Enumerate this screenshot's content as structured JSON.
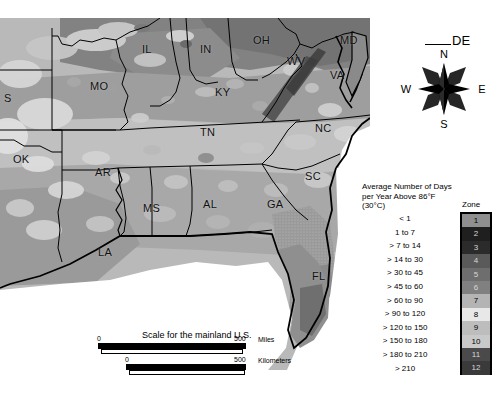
{
  "map": {
    "title": "Average Number of Days per Year Above 86°F (30°C)",
    "background_color": "#b9b9b9",
    "state_labels": [
      {
        "abbr": "S",
        "x": 4,
        "y": 74,
        "note": "Kansas, clipped at left edge"
      },
      {
        "abbr": "IL",
        "x": 142,
        "y": 25,
        "note": "Illinois"
      },
      {
        "abbr": "IN",
        "x": 200,
        "y": 25,
        "note": "Indiana"
      },
      {
        "abbr": "OH",
        "x": 253,
        "y": 16,
        "note": "Ohio"
      },
      {
        "abbr": "WV",
        "x": 287,
        "y": 37,
        "note": "West Virginia"
      },
      {
        "abbr": "MD",
        "x": 340,
        "y": 16,
        "note": "Maryland"
      },
      {
        "abbr": "VA",
        "x": 330,
        "y": 51,
        "note": "Virginia"
      },
      {
        "abbr": "MO",
        "x": 90,
        "y": 62,
        "note": "Missouri"
      },
      {
        "abbr": "KY",
        "x": 215,
        "y": 68,
        "note": "Kentucky"
      },
      {
        "abbr": "NC",
        "x": 315,
        "y": 104,
        "note": "North Carolina"
      },
      {
        "abbr": "TN",
        "x": 200,
        "y": 108,
        "note": "Tennessee"
      },
      {
        "abbr": "OK",
        "x": 13,
        "y": 135,
        "note": "Oklahoma"
      },
      {
        "abbr": "AR",
        "x": 95,
        "y": 148,
        "note": "Arkansas"
      },
      {
        "abbr": "SC",
        "x": 305,
        "y": 152,
        "note": "South Carolina"
      },
      {
        "abbr": "MS",
        "x": 143,
        "y": 184,
        "note": "Mississippi"
      },
      {
        "abbr": "AL",
        "x": 203,
        "y": 180,
        "note": "Alabama"
      },
      {
        "abbr": "GA",
        "x": 267,
        "y": 180,
        "note": "Georgia"
      },
      {
        "abbr": "LA",
        "x": 98,
        "y": 228,
        "note": "Louisiana"
      },
      {
        "abbr": "FL",
        "x": 312,
        "y": 252,
        "note": "Florida"
      }
    ],
    "callout": {
      "label": "DE",
      "note": "Delaware leader line"
    }
  },
  "compass": {
    "north": "N",
    "east": "E",
    "south": "S",
    "west": "W"
  },
  "scale": {
    "title": "Scale for the mainland U.S.",
    "miles": {
      "min": "0",
      "max": "500",
      "unit": "Miles"
    },
    "kilometers": {
      "min": "0",
      "max": "500",
      "unit": "Kilometers"
    }
  },
  "legend": {
    "title": "Average Number of Days per Year Above 86°F (30°C)",
    "zone_header": "Zone",
    "rows": [
      {
        "range": "< 1",
        "zone": "1",
        "color": "#8f8f8f"
      },
      {
        "range": "1 to 7",
        "zone": "2",
        "color": "#1f1f1f"
      },
      {
        "range": "> 7 to 14",
        "zone": "3",
        "color": "#2b2b2b"
      },
      {
        "range": "> 14 to 30",
        "zone": "4",
        "color": "#5a5a5a"
      },
      {
        "range": "> 30 to 45",
        "zone": "5",
        "color": "#6e6e6e"
      },
      {
        "range": "> 45 to 60",
        "zone": "6",
        "color": "#808080"
      },
      {
        "range": "> 60 to 90",
        "zone": "7",
        "color": "#b4b4b4"
      },
      {
        "range": "> 90 to 120",
        "zone": "8",
        "color": "#e8e8e8"
      },
      {
        "range": "> 120 to 150",
        "zone": "9",
        "color": "#bdbdbd"
      },
      {
        "range": "> 150 to 180",
        "zone": "10",
        "color": "#c9c9c9"
      },
      {
        "range": "> 180 to 210",
        "zone": "11",
        "color": "#4a4a4a"
      },
      {
        "range": "> 210",
        "zone": "12",
        "color": "#3a3a3a"
      }
    ]
  },
  "chart_data": {
    "type": "heatmap",
    "title": "Average Number of Days per Year Above 86°F (30°C)",
    "xlabel": "",
    "ylabel": "",
    "legend_position": "right",
    "grid": false,
    "categories": [
      "< 1",
      "1 to 7",
      "> 7 to 14",
      "> 14 to 30",
      "> 30 to 45",
      "> 45 to 60",
      "> 60 to 90",
      "> 90 to 120",
      "> 120 to 150",
      "> 150 to 180",
      "> 180 to 210",
      "> 210"
    ],
    "values": [
      1,
      2,
      3,
      4,
      5,
      6,
      7,
      8,
      9,
      10,
      11,
      12
    ],
    "series": [
      {
        "name": "Zone",
        "values": [
          1,
          2,
          3,
          4,
          5,
          6,
          7,
          8,
          9,
          10,
          11,
          12
        ]
      }
    ]
  }
}
